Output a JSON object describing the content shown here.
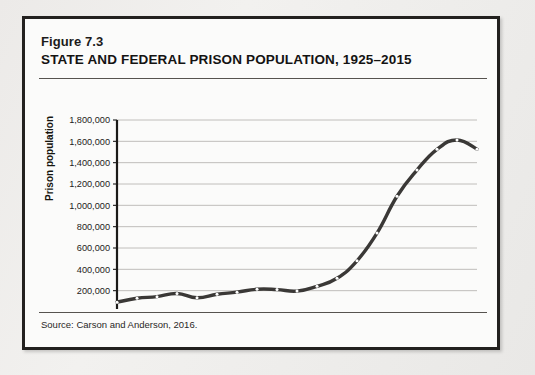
{
  "figure": {
    "number": "Figure 7.3",
    "title": "STATE AND FEDERAL PRISON POPULATION, 1925–2015",
    "source": "Source:  Carson and Anderson, 2016."
  },
  "chart_data": {
    "type": "line",
    "title": "STATE AND FEDERAL PRISON POPULATION, 1925–2015",
    "xlabel": "",
    "ylabel": "Prison population",
    "xlim": [
      1925,
      2015
    ],
    "ylim": [
      0,
      1800000
    ],
    "grid": true,
    "legend": null,
    "line_color": "#3a3836",
    "marker_color": "#ffffff",
    "y_ticks": [
      0,
      200000,
      400000,
      600000,
      800000,
      1000000,
      1200000,
      1400000,
      1600000,
      1800000
    ],
    "y_tick_labels": [
      "0",
      "200,000",
      "400,000",
      "600,000",
      "800,000",
      "1,000,000",
      "1,200,000",
      "1,400,000",
      "1,600,000",
      "1,800,000"
    ],
    "x_ticks": [
      1925,
      1935,
      1945,
      1955,
      1965,
      1975,
      1985,
      1995,
      2005,
      2015
    ],
    "x_tick_labels": [
      "1925",
      "1935",
      "1945",
      "1955",
      "1965",
      "1975",
      "1985",
      "1995",
      "2005",
      "2015"
    ],
    "x_minor_step": 5,
    "x": [
      1925,
      1930,
      1935,
      1940,
      1945,
      1950,
      1955,
      1960,
      1965,
      1970,
      1975,
      1980,
      1985,
      1990,
      1995,
      2000,
      2005,
      2010,
      2015
    ],
    "y": [
      92000,
      129000,
      144000,
      174000,
      133000,
      166000,
      186000,
      213000,
      210000,
      196000,
      241000,
      316000,
      480000,
      740000,
      1085000,
      1331000,
      1525000,
      1613000,
      1526000
    ],
    "series": [
      {
        "name": "Prison population",
        "values": [
          92000,
          129000,
          144000,
          174000,
          133000,
          166000,
          186000,
          213000,
          210000,
          196000,
          241000,
          316000,
          480000,
          740000,
          1085000,
          1331000,
          1525000,
          1613000,
          1526000
        ]
      }
    ]
  }
}
